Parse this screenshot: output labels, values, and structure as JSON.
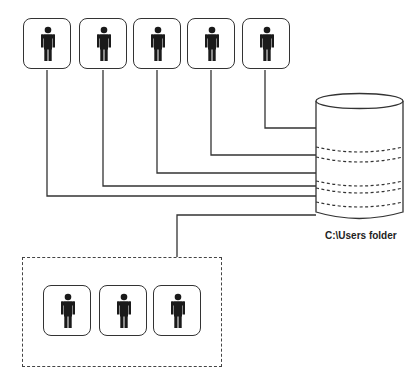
{
  "diagram": {
    "title": "",
    "storage": {
      "label": "C:\\Users folder",
      "icon": "database-cylinder-icon",
      "segments": 5
    },
    "top_users": [
      {
        "id": "user-1",
        "icon": "person-icon"
      },
      {
        "id": "user-2",
        "icon": "person-icon"
      },
      {
        "id": "user-3",
        "icon": "person-icon"
      },
      {
        "id": "user-4",
        "icon": "person-icon"
      },
      {
        "id": "user-5",
        "icon": "person-icon"
      }
    ],
    "group_users": [
      {
        "id": "group-user-1",
        "icon": "person-icon"
      },
      {
        "id": "group-user-2",
        "icon": "person-icon"
      },
      {
        "id": "group-user-3",
        "icon": "person-icon"
      }
    ],
    "colors": {
      "stroke": "#333333",
      "figure": "#1a1a1a",
      "background": "#ffffff"
    }
  }
}
